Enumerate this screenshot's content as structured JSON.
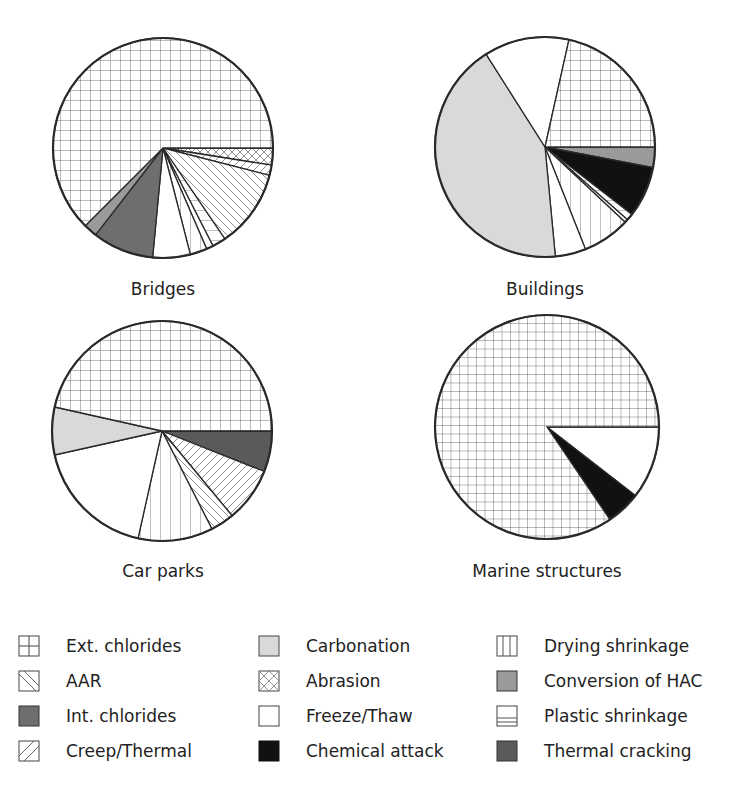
{
  "chart_data": [
    {
      "type": "pie",
      "title": "Bridges",
      "slices": [
        {
          "label": "Abrasion",
          "value": 2.5
        },
        {
          "label": "Creep/Thermal",
          "value": 1.5
        },
        {
          "label": "AAR",
          "value": 11.5
        },
        {
          "label": "Plastic shrinkage",
          "value": 2
        },
        {
          "label": "Freeze/Thaw (thin)",
          "value": 1
        },
        {
          "label": "Drying shrinkage",
          "value": 2.5
        },
        {
          "label": "Freeze/Thaw",
          "value": 5.5
        },
        {
          "label": "Int. chlorides",
          "value": 9
        },
        {
          "label": "Conversion of HAC",
          "value": 2
        },
        {
          "label": "Ext. chlorides",
          "value": 62.5
        }
      ]
    },
    {
      "type": "pie",
      "title": "Buildings",
      "slices": [
        {
          "label": "Conversion of HAC",
          "value": 3
        },
        {
          "label": "Chemical attack",
          "value": 7.5
        },
        {
          "label": "Plastic shrinkage",
          "value": 1
        },
        {
          "label": "Freeze/Thaw (thin)",
          "value": 0.5
        },
        {
          "label": "Drying shrinkage",
          "value": 7
        },
        {
          "label": "Freeze/Thaw",
          "value": 4.5
        },
        {
          "label": "Carbonation",
          "value": 42.5
        },
        {
          "label": "Freeze/Thaw",
          "value": 12.5
        },
        {
          "label": "Ext. chlorides",
          "value": 21.5
        }
      ]
    },
    {
      "type": "pie",
      "title": "Car parks",
      "slices": [
        {
          "label": "Thermal cracking",
          "value": 6
        },
        {
          "label": "Creep/Thermal",
          "value": 8
        },
        {
          "label": "AAR",
          "value": 3.5
        },
        {
          "label": "Drying shrinkage",
          "value": 11
        },
        {
          "label": "Freeze/Thaw",
          "value": 18
        },
        {
          "label": "Carbonation",
          "value": 7
        },
        {
          "label": "Ext. chlorides",
          "value": 46.5
        }
      ]
    },
    {
      "type": "pie",
      "title": "Marine structures",
      "slices": [
        {
          "label": "Freeze/Thaw",
          "value": 10.5
        },
        {
          "label": "Chemical attack",
          "value": 5
        },
        {
          "label": "Ext. chlorides",
          "value": 84.5
        }
      ]
    }
  ],
  "labels": {
    "bridges": "Bridges",
    "buildings": "Buildings",
    "car_parks": "Car parks",
    "marine": "Marine structures"
  },
  "legend": [
    {
      "label": "Ext. chlorides",
      "pattern": "grid"
    },
    {
      "label": "AAR",
      "pattern": "diag-down"
    },
    {
      "label": "Int. chlorides",
      "pattern": "dark-gray",
      "color": "#6e6e6e"
    },
    {
      "label": "Creep/Thermal",
      "pattern": "diag-up"
    },
    {
      "label": "Carbonation",
      "pattern": "light-gray",
      "color": "#d9d9d9"
    },
    {
      "label": "Abrasion",
      "pattern": "crosshatch"
    },
    {
      "label": "Freeze/Thaw",
      "pattern": "white",
      "color": "#ffffff"
    },
    {
      "label": "Chemical attack",
      "pattern": "black",
      "color": "#111111"
    },
    {
      "label": "Drying shrinkage",
      "pattern": "vertical"
    },
    {
      "label": "Conversion of HAC",
      "pattern": "mid-gray",
      "color": "#9a9a9a"
    },
    {
      "label": "Plastic shrinkage",
      "pattern": "horizontal"
    },
    {
      "label": "Thermal cracking",
      "pattern": "dark-gray2",
      "color": "#5a5a5a"
    }
  ]
}
